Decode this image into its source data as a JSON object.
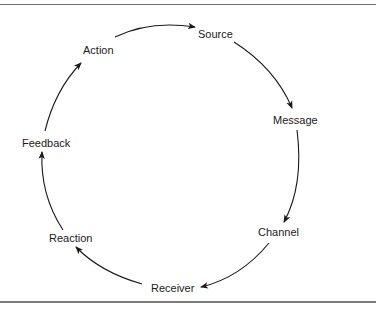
{
  "diagram": {
    "type": "cycle",
    "nodes": [
      {
        "id": "source",
        "label": "Source",
        "x": 198,
        "y": 28
      },
      {
        "id": "message",
        "label": "Message",
        "x": 273,
        "y": 114
      },
      {
        "id": "channel",
        "label": "Channel",
        "x": 258,
        "y": 226
      },
      {
        "id": "receiver",
        "label": "Receiver",
        "x": 151,
        "y": 282
      },
      {
        "id": "reaction",
        "label": "Reaction",
        "x": 49,
        "y": 232
      },
      {
        "id": "feedback",
        "label": "Feedback",
        "x": 22,
        "y": 137
      },
      {
        "id": "action",
        "label": "Action",
        "x": 83,
        "y": 44
      }
    ],
    "edges": [
      {
        "from": "action",
        "to": "source"
      },
      {
        "from": "source",
        "to": "message"
      },
      {
        "from": "message",
        "to": "channel"
      },
      {
        "from": "channel",
        "to": "receiver"
      },
      {
        "from": "receiver",
        "to": "reaction"
      },
      {
        "from": "reaction",
        "to": "feedback"
      },
      {
        "from": "feedback",
        "to": "action"
      }
    ]
  }
}
